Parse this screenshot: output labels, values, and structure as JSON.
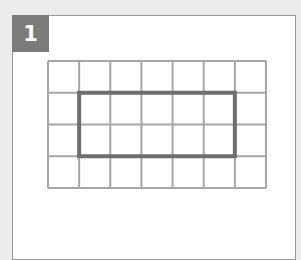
{
  "figure": {
    "label": "1",
    "grid": {
      "columns": 7,
      "rows": 4,
      "line_color": "#a6a6a6",
      "x": 48,
      "y": 61,
      "width": 218,
      "height": 127
    },
    "highlight_rect": {
      "col_start": 1,
      "col_end": 6,
      "row_start": 1,
      "row_end": 3,
      "color": "#6e6e6e"
    }
  }
}
